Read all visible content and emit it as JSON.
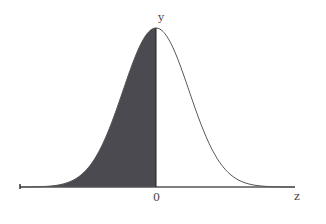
{
  "chart_data": {
    "type": "area",
    "title": "",
    "xlabel": "z",
    "ylabel": "y",
    "x_tick_labels": [
      "0"
    ],
    "mean": 0,
    "shaded_region": {
      "from": "-inf",
      "to": 0,
      "area": 0.5
    },
    "grid": false,
    "legend": null,
    "colors": {
      "shade": "#4a4a50",
      "curve": "#555555",
      "axis": "#555555"
    }
  },
  "labels": {
    "y_axis": "y",
    "x_axis": "z",
    "origin": "0"
  }
}
